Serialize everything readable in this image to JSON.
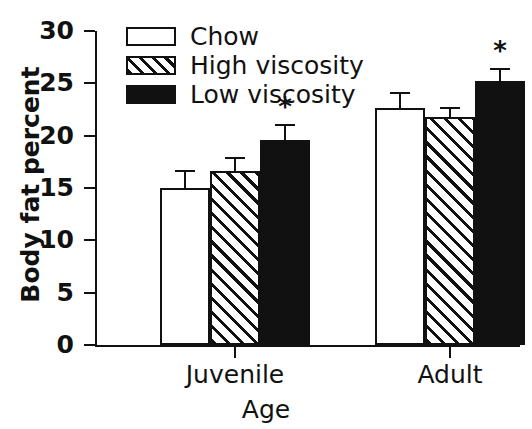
{
  "chart_data": {
    "type": "bar",
    "title": "",
    "subtitle": "",
    "xlabel": "Age",
    "ylabel": "Body fat percent",
    "categories": [
      "Juvenile",
      "Adult"
    ],
    "ylim": [
      0,
      30
    ],
    "yticks": [
      0,
      5,
      10,
      15,
      20,
      25,
      30
    ],
    "ytick_labels": [
      "0",
      "5",
      "10",
      "15",
      "20",
      "25",
      "30"
    ],
    "grid": false,
    "legend_position": "top-left-inside",
    "series": [
      {
        "name": "Chow",
        "fill": "white",
        "values": [
          15.0,
          22.6
        ],
        "errors": [
          1.7,
          1.6
        ],
        "annotations": [
          "",
          ""
        ]
      },
      {
        "name": "High viscosity",
        "fill": "hatch",
        "values": [
          16.6,
          21.8
        ],
        "errors": [
          1.4,
          0.9
        ],
        "annotations": [
          "",
          ""
        ]
      },
      {
        "name": "Low viscosity",
        "fill": "black",
        "values": [
          19.6,
          25.2
        ],
        "errors": [
          1.5,
          1.3
        ],
        "annotations": [
          "*",
          "*"
        ]
      }
    ],
    "annotation_symbol": "*",
    "colors": {
      "axis": "#111111",
      "bar_outline": "#111111",
      "chow": "#ffffff",
      "high_viscosity": "#ffffff",
      "low_viscosity": "#111111"
    }
  },
  "legend": {
    "items": [
      {
        "label": "Chow",
        "swatch": "white-swatch"
      },
      {
        "label": "High viscosity",
        "swatch": "hatched-swatch"
      },
      {
        "label": "Low viscosity",
        "swatch": "black-swatch"
      }
    ]
  },
  "axes": {
    "y_title": "Body fat percent",
    "x_title": "Age",
    "y_labels": [
      "30",
      "25",
      "20",
      "15",
      "10",
      "5",
      "0"
    ],
    "x_labels": [
      "Juvenile",
      "Adult"
    ]
  }
}
